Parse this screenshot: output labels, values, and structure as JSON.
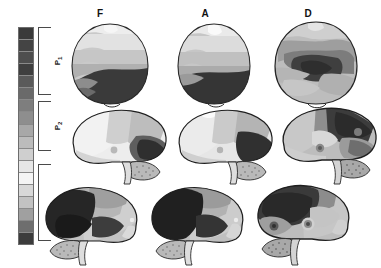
{
  "figure": {
    "background_color": "#ffffff"
  },
  "legend": {
    "name": "colorbar",
    "orientation": "vertical",
    "segment_count": 18,
    "segments": [
      "#3a3a3a",
      "#444444",
      "#4e4e4e",
      "#3f3f3f",
      "#5a5a5a",
      "#6a6a6a",
      "#7e7e7e",
      "#8e8e8e",
      "#a8a8a8",
      "#bcbcbc",
      "#cfcfcf",
      "#e6e6e6",
      "#f4f4f4",
      "#d8d8d8",
      "#c2c2c2",
      "#a0a0a0",
      "#6e6e6e",
      "#3c3c3c"
    ],
    "brackets": [
      {
        "id": "P1",
        "label": "P",
        "subscript": "1",
        "top_pct": 0.0,
        "height_pct": 31.0
      },
      {
        "id": "P2",
        "label": "P",
        "subscript": "2",
        "top_pct": 34.0,
        "height_pct": 23.0
      },
      {
        "id": "P3",
        "label": "P",
        "subscript": "3",
        "top_pct": 63.0,
        "height_pct": 35.0
      }
    ]
  },
  "columns": [
    {
      "id": "F",
      "label": "F",
      "x": 30
    },
    {
      "id": "A",
      "label": "A",
      "x": 135
    },
    {
      "id": "D",
      "label": "D",
      "x": 238
    }
  ],
  "rows": [
    {
      "id": "row-axial",
      "view": "axial"
    },
    {
      "id": "row-lateral-1",
      "view": "lateral-left"
    },
    {
      "id": "row-lateral-2",
      "view": "lateral-right"
    }
  ],
  "chart_data": {
    "type": "heatmap",
    "title": "",
    "xlabel": "",
    "ylabel": "",
    "legend_position": "left",
    "grid": false,
    "colorscale": "grayscale-discrete-18",
    "categories": [
      "F",
      "A",
      "D"
    ],
    "row_categories": [
      "axial",
      "lateral-left",
      "lateral-right"
    ],
    "series": [
      {
        "name": "F",
        "values": [
          {
            "view": "axial",
            "anterior": 0.82,
            "central": 0.62,
            "posterior": 0.16,
            "deep": 0.48
          },
          {
            "view": "lateral-left",
            "frontal": 0.88,
            "parietal": 0.58,
            "temporal": 0.3,
            "occipital": 0.14
          },
          {
            "view": "lateral-right",
            "frontal": 0.18,
            "parietal": 0.7,
            "temporal": 0.22,
            "occipital": 0.6
          }
        ]
      },
      {
        "name": "A",
        "values": [
          {
            "view": "axial",
            "anterior": 0.78,
            "central": 0.6,
            "posterior": 0.12,
            "deep": 0.46
          },
          {
            "view": "lateral-left",
            "frontal": 0.86,
            "parietal": 0.56,
            "temporal": 0.34,
            "occipital": 0.12
          },
          {
            "view": "lateral-right",
            "frontal": 0.14,
            "parietal": 0.66,
            "temporal": 0.2,
            "occipital": 0.58
          }
        ]
      },
      {
        "name": "D",
        "values": [
          {
            "view": "axial",
            "anterior": 0.66,
            "central": 0.2,
            "posterior": 0.52,
            "deep": 0.1
          },
          {
            "view": "lateral-left",
            "frontal": 0.64,
            "parietal": 0.22,
            "temporal": 0.46,
            "occipital": 0.3
          },
          {
            "view": "lateral-right",
            "frontal": 0.26,
            "parietal": 0.44,
            "temporal": 0.34,
            "occipital": 0.56
          }
        ]
      }
    ]
  }
}
